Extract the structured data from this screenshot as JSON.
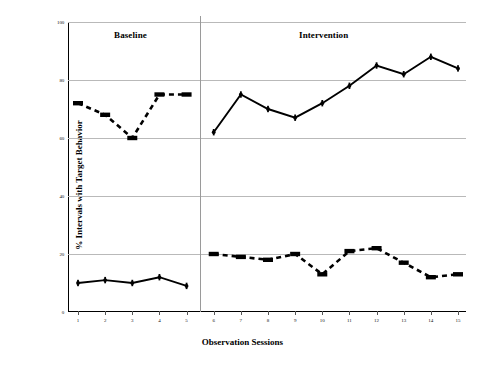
{
  "axes": {
    "y_title": "% Intervals with Target Behavior",
    "x_title": "Observation Sessions",
    "y_ticks": [
      {
        "value": 0,
        "label": "0"
      },
      {
        "value": 20,
        "label": "20"
      },
      {
        "value": 40,
        "label": "40"
      },
      {
        "value": 60,
        "label": "60"
      },
      {
        "value": 80,
        "label": "80"
      },
      {
        "value": 100,
        "label": "100"
      }
    ],
    "x_ticks": [
      "1",
      "2",
      "3",
      "4",
      "5",
      "6",
      "7",
      "8",
      "9",
      "10",
      "11",
      "12",
      "13",
      "14",
      "15"
    ]
  },
  "phases": [
    {
      "name": "baseline",
      "label": "Baseline",
      "sessions": [
        1,
        5
      ]
    },
    {
      "name": "intervention",
      "label": "Intervention",
      "sessions": [
        6,
        15
      ]
    }
  ],
  "phase_divider_after_session": 5,
  "chart_data": {
    "type": "line",
    "title": "",
    "xlabel": "Observation Sessions",
    "ylabel": "% Intervals with Target Behavior",
    "xlim": [
      1,
      15
    ],
    "ylim": [
      0,
      100
    ],
    "grid": true,
    "legend": "none",
    "x": [
      1,
      2,
      3,
      4,
      5,
      6,
      7,
      8,
      9,
      10,
      11,
      12,
      13,
      14,
      15
    ],
    "series": [
      {
        "name": "Target behavior - baseline",
        "phase": "baseline",
        "marker": "bar",
        "linestyle": "dashed",
        "x": [
          1,
          2,
          3,
          4,
          5
        ],
        "values": [
          72,
          68,
          60,
          75,
          75
        ]
      },
      {
        "name": "Target behavior - intervention",
        "phase": "intervention",
        "marker": "dot",
        "linestyle": "solid",
        "x": [
          6,
          7,
          8,
          9,
          10,
          11,
          12,
          13,
          14,
          15
        ],
        "values": [
          62,
          75,
          70,
          67,
          72,
          78,
          85,
          82,
          88,
          84
        ]
      },
      {
        "name": "Comparison behavior - baseline",
        "phase": "baseline",
        "marker": "dot",
        "linestyle": "solid",
        "x": [
          1,
          2,
          3,
          4,
          5
        ],
        "values": [
          10,
          11,
          10,
          12,
          9
        ]
      },
      {
        "name": "Comparison behavior - intervention",
        "phase": "intervention",
        "marker": "bar",
        "linestyle": "dashed",
        "x": [
          6,
          7,
          8,
          9,
          10,
          11,
          12,
          13,
          14,
          15
        ],
        "values": [
          20,
          19,
          18,
          20,
          13,
          21,
          22,
          17,
          12,
          13
        ]
      }
    ]
  },
  "colors": {
    "line": "#000000",
    "grid": "#b9b9b9",
    "axis": "#000000",
    "divider": "#9a9a9a",
    "background": "#ffffff"
  }
}
